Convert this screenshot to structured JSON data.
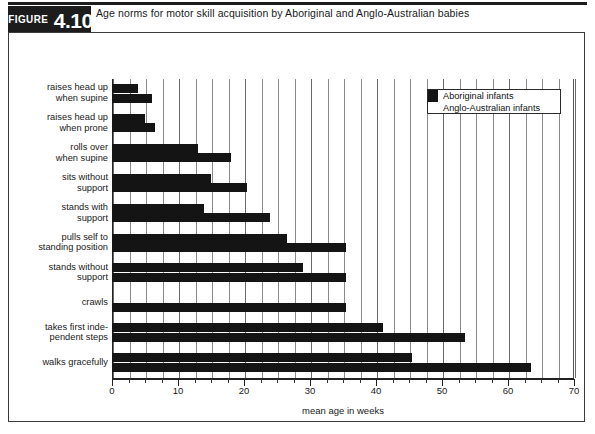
{
  "figure": {
    "tag_word": "FIGURE",
    "number": "4.10",
    "title": "Age norms for motor skill acquisition by Aboriginal and Anglo-Australian babies"
  },
  "legend": {
    "position": "top-right",
    "items": [
      {
        "label": "Aboriginal infants",
        "color": "#141414"
      },
      {
        "label": "Anglo-Australian infants",
        "color": "#ffffff"
      }
    ]
  },
  "chart_data": {
    "type": "bar",
    "orientation": "horizontal",
    "title": "Age norms for motor skill acquisition by Aboriginal and Anglo-Australian babies",
    "xlabel": "mean age in weeks",
    "ylabel": "",
    "xlim": [
      0,
      70
    ],
    "xticks": [
      0,
      10,
      20,
      30,
      40,
      50,
      60,
      70
    ],
    "xticklabels": [
      "0",
      "10",
      "20",
      "30",
      "40",
      "50",
      "60",
      "70"
    ],
    "minor_tick_step": 2.5,
    "grid": "vertical",
    "legend_position": "upper right",
    "categories": [
      "raises head up when supine",
      "raises head up when prone",
      "rolls over when supine",
      "sits without support",
      "stands with support",
      "pulls self to standing position",
      "stands without support",
      "crawls",
      "takes first independent steps",
      "walks gracefully"
    ],
    "category_lines": [
      [
        "raises head up",
        "when supine"
      ],
      [
        "raises head up",
        "when prone"
      ],
      [
        "rolls over",
        "when supine"
      ],
      [
        "sits without",
        "support"
      ],
      [
        "stands with",
        "support"
      ],
      [
        "pulls self to",
        "standing position"
      ],
      [
        "stands without",
        "support"
      ],
      [
        "crawls"
      ],
      [
        "takes first inde-",
        "pendent steps"
      ],
      [
        "walks gracefully"
      ]
    ],
    "series": [
      {
        "name": "Aboriginal infants",
        "color": "#141414",
        "values": [
          4,
          5,
          13,
          15,
          14,
          26.5,
          29,
          0,
          41,
          45.5
        ]
      },
      {
        "name": "Anglo-Australian infants",
        "color": "#141414",
        "values": [
          6,
          6.5,
          18,
          20.5,
          24,
          35.5,
          35.5,
          35.5,
          53.5,
          63.5
        ]
      }
    ]
  }
}
